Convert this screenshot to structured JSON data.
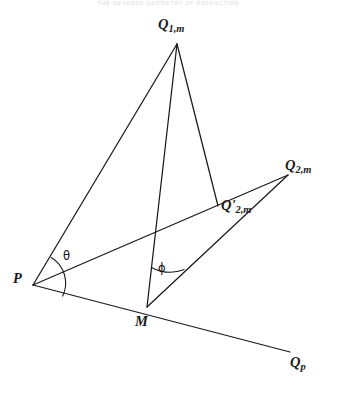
{
  "page": {
    "running_header": "THE REVERSE GEOMETRY OF REFRACTION",
    "width": 337,
    "height": 397,
    "background": "#ffffff",
    "ink_color": "#1a1a1a"
  },
  "figure": {
    "type": "geometric-diagram",
    "points": [
      {
        "id": "Q1m",
        "label": "Q",
        "subscript": "1,m",
        "x": 177,
        "y": 44,
        "label_x": 160,
        "label_y": 18
      },
      {
        "id": "P",
        "label": "P",
        "subscript": "",
        "x": 33,
        "y": 285,
        "label_x": 14,
        "label_y": 272
      },
      {
        "id": "M",
        "label": "M",
        "subscript": "",
        "x": 147,
        "y": 307,
        "label_x": 136,
        "label_y": 315
      },
      {
        "id": "Q2mp",
        "label": "Q'",
        "subscript": "2,m",
        "x": 218,
        "y": 206,
        "label_x": 222,
        "label_y": 199
      },
      {
        "id": "Q2m",
        "label": "Q",
        "subscript": "2,m",
        "x": 288,
        "y": 175,
        "label_x": 286,
        "label_y": 159
      },
      {
        "id": "Qp",
        "label": "Q",
        "subscript": "p",
        "x": 290,
        "y": 352,
        "label_x": 291,
        "label_y": 355
      }
    ],
    "segments": [
      {
        "id": "Q1m-P",
        "from": "Q1m",
        "to": "P"
      },
      {
        "id": "Q1m-M",
        "from": "Q1m",
        "to": "M"
      },
      {
        "id": "Q1m-Q2mp",
        "from": "Q1m",
        "to": "Q2mp"
      },
      {
        "id": "P-Q2m",
        "from": "P",
        "to": "Q2m"
      },
      {
        "id": "M-Q2m",
        "from": "M",
        "to": "Q2m"
      },
      {
        "id": "P-Qp",
        "from": "P",
        "to": "Qp"
      }
    ],
    "angles": [
      {
        "id": "theta",
        "glyph": "θ",
        "vertex": "P",
        "label_x": 63,
        "label_y": 249,
        "radius": 30
      },
      {
        "id": "phi",
        "glyph": "ϕ",
        "vertex": "M",
        "label_x": 158,
        "label_y": 261,
        "radius": 40
      }
    ]
  }
}
